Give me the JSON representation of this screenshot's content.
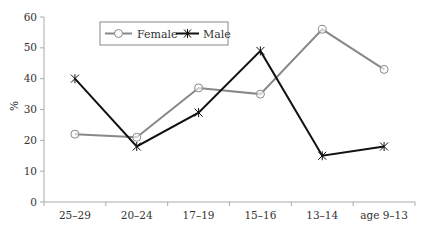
{
  "chart_data": {
    "type": "line",
    "title": "",
    "xlabel": "",
    "ylabel": "%",
    "ylim": [
      0,
      60
    ],
    "yticks": [
      0,
      10,
      20,
      30,
      40,
      50,
      60
    ],
    "grid": false,
    "legend_position": "top-left-inside",
    "categories": [
      "25–29",
      "20–24",
      "17–19",
      "15–16",
      "13–14",
      "age 9–13"
    ],
    "series": [
      {
        "name": "Female",
        "values": [
          22,
          21,
          37,
          35,
          56,
          43
        ],
        "color": "#888888",
        "marker": "circle"
      },
      {
        "name": "Male",
        "values": [
          40,
          18,
          29,
          49,
          15,
          18
        ],
        "color": "#111111",
        "marker": "asterisk"
      }
    ]
  },
  "legend": {
    "female_label": "Female",
    "male_label": "Male"
  },
  "axes": {
    "ylabel": "%",
    "ytick_labels": [
      "0",
      "10",
      "20",
      "30",
      "40",
      "50",
      "60"
    ],
    "xtick_labels": [
      "25–29",
      "20–24",
      "17–19",
      "15–16",
      "13–14",
      "age 9–13"
    ]
  }
}
